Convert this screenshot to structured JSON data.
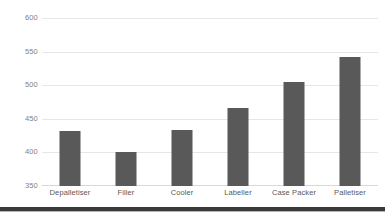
{
  "chart_data": {
    "type": "bar",
    "title": "",
    "xlabel": "",
    "ylabel": "",
    "categories": [
      "Depalletiser",
      "Filler",
      "Cooler",
      "Labeller",
      "Case Packer",
      "Palletiser"
    ],
    "values": [
      432,
      401,
      433,
      466,
      505,
      542
    ],
    "series": [
      {
        "name": "",
        "values": [
          432,
          401,
          433,
          466,
          505,
          542
        ]
      }
    ],
    "ylim": [
      350,
      600
    ],
    "ytick_labels": [
      "600",
      "550",
      "500",
      "450",
      "400",
      "350"
    ],
    "ytick_values": [
      600,
      550,
      500,
      450,
      400,
      350
    ],
    "grid": true,
    "legend": false,
    "legend_position": "none",
    "bar_color": "#595959",
    "gridline_color": "#E6E6E6",
    "tick_label_color": "#7F7F7F",
    "category_label_color": "#595959",
    "background_color": "#FFFFFF"
  },
  "decorations": {
    "bottom_rule_color": "#3A3A3A"
  }
}
